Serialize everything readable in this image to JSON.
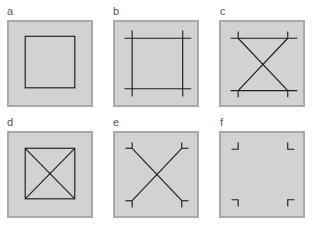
{
  "figure": {
    "panels": [
      {
        "id": "a",
        "label": "a",
        "description": "square outline"
      },
      {
        "id": "b",
        "label": "b",
        "description": "square with extended crossing edges"
      },
      {
        "id": "c",
        "label": "c",
        "description": "top and bottom lines with X diagonals and corner ticks"
      },
      {
        "id": "d",
        "label": "d",
        "description": "square with both diagonals"
      },
      {
        "id": "e",
        "label": "e",
        "description": "X diagonals with corner ticks"
      },
      {
        "id": "f",
        "label": "f",
        "description": "corner brackets only"
      }
    ],
    "colors": {
      "panel_fill": "#d2d2d2",
      "panel_border": "#a8a8a8",
      "stroke": "#1e1e1e"
    }
  }
}
